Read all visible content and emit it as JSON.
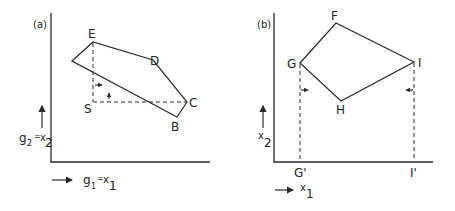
{
  "panels": [
    {
      "id": "a",
      "tag": "(a)",
      "y_axis_label": {
        "main": "g",
        "sub": "2",
        "eq": "=",
        "var": "x",
        "var_sub": "2"
      },
      "x_axis_label": {
        "main": "g",
        "sub": "1",
        "eq": "=",
        "var": "x",
        "var_sub": "1"
      },
      "vertices": {
        "E": "E",
        "D": "D",
        "C": "C",
        "B": "B",
        "S": "S"
      }
    },
    {
      "id": "b",
      "tag": "(b)",
      "y_axis_label": {
        "var": "x",
        "var_sub": "2"
      },
      "x_axis_label": {
        "var": "x",
        "var_sub": "1"
      },
      "vertices": {
        "F": "F",
        "G": "G",
        "H": "H",
        "I": "I"
      },
      "projections": {
        "G_prime": "G'",
        "I_prime": "I'"
      }
    }
  ]
}
